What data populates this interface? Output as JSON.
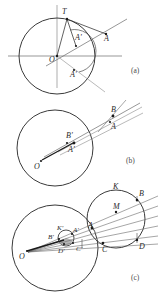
{
  "figure": {
    "type": "geometric-diagram",
    "panels": [
      {
        "id": "a",
        "caption": "(a)",
        "labels": [
          {
            "name": "T",
            "text": "T",
            "x": 62,
            "y": 12
          },
          {
            "name": "O",
            "text": "O",
            "x": 50,
            "y": 59
          },
          {
            "name": "A",
            "text": "A",
            "x": 103,
            "y": 33
          },
          {
            "name": "A-prime",
            "text": "A'",
            "x": 76,
            "y": 38
          },
          {
            "name": "A-double-prime",
            "text": "A'",
            "x": 70,
            "y": 74
          }
        ]
      },
      {
        "id": "b",
        "caption": "(b)",
        "labels": [
          {
            "name": "O",
            "text": "O",
            "x": 35,
            "y": 160
          },
          {
            "name": "B-prime",
            "text": "B'",
            "x": 68,
            "y": 135
          },
          {
            "name": "A-prime",
            "text": "A'",
            "x": 69,
            "y": 149
          },
          {
            "name": "B",
            "text": "B",
            "x": 110,
            "y": 111
          },
          {
            "name": "A",
            "text": "A",
            "x": 112,
            "y": 130
          }
        ]
      },
      {
        "id": "c",
        "caption": "(c)",
        "labels": [
          {
            "name": "O",
            "text": "O",
            "x": 20,
            "y": 251
          },
          {
            "name": "K-prime",
            "text": "K'",
            "x": 57,
            "y": 228
          },
          {
            "name": "B-prime",
            "text": "B'",
            "x": 49,
            "y": 236
          },
          {
            "name": "A-prime",
            "text": "A'",
            "x": 75,
            "y": 228
          },
          {
            "name": "D-prime",
            "text": "D'",
            "x": 59,
            "y": 249
          },
          {
            "name": "C-prime",
            "text": "C'",
            "x": 77,
            "y": 247
          },
          {
            "name": "K",
            "text": "K",
            "x": 114,
            "y": 186
          },
          {
            "name": "M",
            "text": "M",
            "x": 115,
            "y": 206
          },
          {
            "name": "A",
            "text": "A",
            "x": 92,
            "y": 221
          },
          {
            "name": "B",
            "text": "B",
            "x": 140,
            "y": 194
          },
          {
            "name": "C",
            "text": "C",
            "x": 104,
            "y": 248
          },
          {
            "name": "D",
            "text": "D",
            "x": 140,
            "y": 246
          }
        ]
      }
    ],
    "captions": [
      {
        "id": "caption-a",
        "text": "(a)",
        "x": 131,
        "y": 70
      },
      {
        "id": "caption-b",
        "text": "(b)",
        "x": 126,
        "y": 160
      },
      {
        "id": "caption-c",
        "text": "(c)",
        "x": 131,
        "y": 277
      }
    ],
    "footnote": "",
    "colors": {
      "stroke": "#3a3a3a",
      "thin_stroke": "#6a6a6a",
      "fill_shade": "#b5b5b5",
      "background": "#ffffff",
      "text": "#2a2a2a"
    }
  }
}
